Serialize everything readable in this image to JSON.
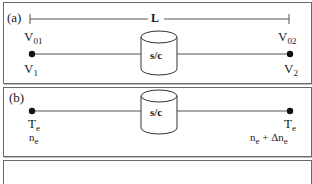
{
  "panels": [
    {
      "id": "a",
      "label": "(a)",
      "length_label": "L",
      "left_ref": {
        "main": "V",
        "sub": "01"
      },
      "right_ref": {
        "main": "V",
        "sub": "02"
      },
      "left_node": {
        "main": "V",
        "sub": "1"
      },
      "right_node": {
        "main": "V",
        "sub": "2"
      },
      "spacecraft_label": "s/c"
    },
    {
      "id": "b",
      "label": "(b)",
      "left_node": {
        "line1_main": "T",
        "line1_sub": "e",
        "line2_main": "n",
        "line2_sub": "e"
      },
      "right_node": {
        "line1_main": "T",
        "line1_sub": "e",
        "line2_text": "n",
        "line2_sub": "e",
        "line2_plus": " + Δn",
        "line2_sub2": "e"
      },
      "spacecraft_label": "s/c"
    },
    {
      "id": "c",
      "label": ""
    }
  ],
  "colors": {
    "line": "#555555",
    "border": "#6a6a6a",
    "node": "#111111"
  }
}
